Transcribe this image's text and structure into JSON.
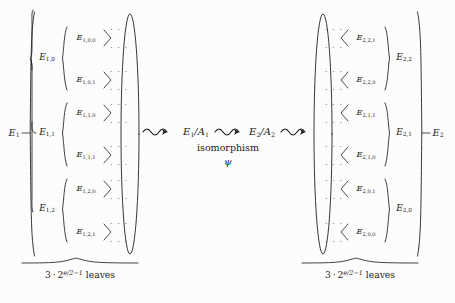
{
  "figure": {
    "type": "binary-tree-isomorphism-diagram",
    "background_color": "#fdfdfd",
    "ink_color": "#1a1a1a"
  },
  "left_tree": {
    "root": {
      "base": "E",
      "sub": "1",
      "x": 14,
      "y": 133
    },
    "level1": [
      {
        "base": "E",
        "sub": "1,0",
        "x": 47,
        "y": 58
      },
      {
        "base": "E",
        "sub": "1,1",
        "x": 47,
        "y": 133
      },
      {
        "base": "E",
        "sub": "1,2",
        "x": 47,
        "y": 209
      }
    ],
    "level2": [
      {
        "base": "E",
        "sub": "1,0,0",
        "x": 86,
        "y": 38
      },
      {
        "base": "E",
        "sub": "1,0,1",
        "x": 86,
        "y": 80
      },
      {
        "base": "E",
        "sub": "1,1,0",
        "x": 86,
        "y": 113
      },
      {
        "base": "E",
        "sub": "1,1,1",
        "x": 86,
        "y": 155
      },
      {
        "base": "E",
        "sub": "1,2,0",
        "x": 86,
        "y": 189
      },
      {
        "base": "E",
        "sub": "1,2,1",
        "x": 86,
        "y": 232
      }
    ],
    "leaf_dots": "· · ·",
    "ellipse": {
      "cx": 130,
      "cy": 134,
      "rx": 9,
      "ry": 120
    },
    "brace_label": {
      "coefficient": "3",
      "operator": "·",
      "base": "2",
      "exponent": "e/2−1",
      "suffix": "leaves",
      "x": 80,
      "y": 273
    }
  },
  "right_tree": {
    "root": {
      "base": "E",
      "sub": "2",
      "x": 438,
      "y": 133
    },
    "level1": [
      {
        "base": "E",
        "sub": "2,2",
        "x": 404,
        "y": 58
      },
      {
        "base": "E",
        "sub": "2,1",
        "x": 404,
        "y": 133
      },
      {
        "base": "E",
        "sub": "2,0",
        "x": 404,
        "y": 209
      }
    ],
    "level2": [
      {
        "base": "E",
        "sub": "2,2,1",
        "x": 366,
        "y": 38
      },
      {
        "base": "E",
        "sub": "2,2,0",
        "x": 366,
        "y": 80
      },
      {
        "base": "E",
        "sub": "2,1,1",
        "x": 366,
        "y": 113
      },
      {
        "base": "E",
        "sub": "2,1,0",
        "x": 366,
        "y": 155
      },
      {
        "base": "E",
        "sub": "2,0,1",
        "x": 366,
        "y": 189
      },
      {
        "base": "E",
        "sub": "2,0,0",
        "x": 366,
        "y": 232
      }
    ],
    "leaf_dots": "· · ·",
    "ellipse": {
      "cx": 323,
      "cy": 134,
      "rx": 9,
      "ry": 120
    },
    "brace_label": {
      "coefficient": "3",
      "operator": "·",
      "base": "2",
      "exponent": "e/2−1",
      "suffix": "leaves",
      "x": 360,
      "y": 273
    }
  },
  "center": {
    "quotient_left": {
      "base": "E",
      "sub": "1",
      "denom_base": "A",
      "denom_sub": "1",
      "x": 196,
      "y": 132
    },
    "quotient_right": {
      "base": "E",
      "sub": "2",
      "denom_base": "A",
      "denom_sub": "2",
      "x": 262,
      "y": 132
    },
    "caption": "isomorphism",
    "caption_x": 228,
    "caption_y": 146,
    "symbol": "ψ",
    "symbol_x": 228,
    "symbol_y": 160
  }
}
